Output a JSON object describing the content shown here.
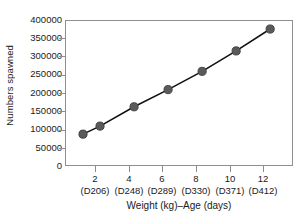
{
  "chart_data": {
    "type": "line",
    "title": "",
    "xlabel": "Weight (kg)–Age (days)",
    "ylabel": "Numbers spawned",
    "x": [
      1,
      2,
      4,
      6,
      8,
      10,
      12
    ],
    "values": [
      90000,
      112000,
      165000,
      212000,
      262000,
      318000,
      378000
    ],
    "series": [
      {
        "name": "Numbers spawned",
        "values": [
          90000,
          112000,
          165000,
          212000,
          262000,
          318000,
          378000
        ]
      }
    ],
    "xlim": [
      0,
      13.4
    ],
    "ylim": [
      0,
      400000
    ],
    "yticks": [
      0,
      50000,
      100000,
      150000,
      200000,
      250000,
      300000,
      350000,
      400000
    ],
    "ytick_labels": [
      "0",
      "50000",
      "100000",
      "150000",
      "200000",
      "250000",
      "300000",
      "350000",
      "400000"
    ],
    "xticks": [
      2,
      4,
      6,
      8,
      10,
      12
    ],
    "xtick_labels": [
      "2",
      "4",
      "6",
      "8",
      "10",
      "12"
    ],
    "xtick_sublabels": [
      "(D206)",
      "(D248)",
      "(D289)",
      "(D330)",
      "(D371)",
      "(D412)"
    ],
    "grid": false,
    "legend": null,
    "marker_color": "#5a5a5a",
    "marker_edge_color": "#3d3d3d",
    "line_color": "#111111",
    "axis_color": "#8e8e8e"
  }
}
